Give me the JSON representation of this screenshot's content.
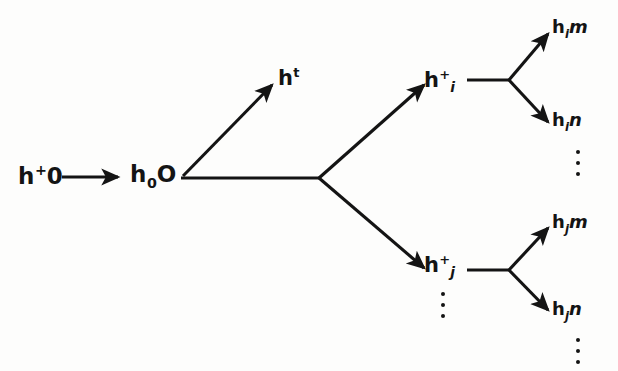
{
  "diagram": {
    "type": "branching-tree",
    "background_color": "#fdfdfc",
    "stroke_color": "#141414",
    "nodes": {
      "root": {
        "id": "h-plus-0",
        "text_parts": {
          "base": "h",
          "sup": "+",
          "tail": "0"
        },
        "display": "h+0",
        "x": 18,
        "y": 163
      },
      "second": {
        "id": "h-0-O",
        "text_parts": {
          "base": "h",
          "sub": "0",
          "tail": "O"
        },
        "display": "h0O",
        "x": 130,
        "y": 163
      },
      "top_branch": {
        "id": "h-t",
        "text_parts": {
          "base": "h",
          "sup": "t"
        },
        "display": "ht",
        "x": 278,
        "y": 66
      },
      "upper_mid": {
        "id": "h-plus-i",
        "text_parts": {
          "base": "h",
          "sup": "+",
          "sub": "i"
        },
        "display": "h+i",
        "x": 424,
        "y": 68
      },
      "lower_mid": {
        "id": "h-plus-j",
        "text_parts": {
          "base": "h",
          "sup": "+",
          "sub": "j"
        },
        "display": "h+j",
        "x": 424,
        "y": 253
      },
      "leaf_im": {
        "id": "h-i-m",
        "text_parts": {
          "base": "h",
          "sub": "i",
          "tail": "m"
        },
        "display": "him",
        "x": 552,
        "y": 18
      },
      "leaf_in": {
        "id": "h-i-n",
        "text_parts": {
          "base": "h",
          "sub": "i",
          "tail": "n"
        },
        "display": "hin",
        "x": 552,
        "y": 111
      },
      "leaf_jm": {
        "id": "h-j-m",
        "text_parts": {
          "base": "h",
          "sub": "j",
          "tail": "m"
        },
        "display": "hjm",
        "x": 552,
        "y": 213
      },
      "leaf_jn": {
        "id": "h-j-n",
        "text_parts": {
          "base": "h",
          "sub": "j",
          "tail": "n"
        },
        "display": "hjn",
        "x": 552,
        "y": 300
      }
    },
    "ellipses": [
      {
        "id": "ellipsis-after-hin",
        "x": 572,
        "y": 150,
        "dots": 3
      },
      {
        "id": "ellipsis-below-hplusj",
        "x": 437,
        "y": 292,
        "dots": 3
      },
      {
        "id": "ellipsis-after-hjn",
        "x": 572,
        "y": 338,
        "dots": 3
      }
    ],
    "edges": [
      {
        "id": "edge-root-to-h0O",
        "from": "h-plus-0",
        "to": "h-0-O",
        "arrow": true,
        "path": "M62,177 L122,177"
      },
      {
        "id": "edge-h0O-to-ht",
        "from": "h-0-O",
        "to": "h-t",
        "arrow": true,
        "path": "M182,176 L276,80"
      },
      {
        "id": "edge-h0O-trunk",
        "from": "h-0-O",
        "to": "split-1",
        "arrow": false,
        "path": "M180,178 L320,178"
      },
      {
        "id": "edge-split-to-hplusi",
        "from": "split-1",
        "to": "h-plus-i",
        "arrow": true,
        "path": "M319,178 L428,80"
      },
      {
        "id": "edge-split-to-hplusj",
        "from": "split-1",
        "to": "h-plus-j",
        "arrow": true,
        "path": "M319,178 L428,272"
      },
      {
        "id": "edge-hplusi-trunk",
        "from": "h-plus-i",
        "to": "split-2",
        "arrow": false,
        "path": "M466,80 L510,80"
      },
      {
        "id": "edge-split2-to-him",
        "from": "split-2",
        "to": "h-i-m",
        "arrow": true,
        "path": "M509,80 L550,30"
      },
      {
        "id": "edge-split2-to-hin",
        "from": "split-2",
        "to": "h-i-n",
        "arrow": true,
        "path": "M509,80 L550,125"
      },
      {
        "id": "edge-hplusj-trunk",
        "from": "h-plus-j",
        "to": "split-3",
        "arrow": false,
        "path": "M466,270 L510,270"
      },
      {
        "id": "edge-split3-to-hjm",
        "from": "split-3",
        "to": "h-j-m",
        "arrow": true,
        "path": "M509,270 L550,225"
      },
      {
        "id": "edge-split3-to-hjn",
        "from": "split-3",
        "to": "h-j-n",
        "arrow": true,
        "path": "M509,270 L550,313"
      }
    ]
  }
}
